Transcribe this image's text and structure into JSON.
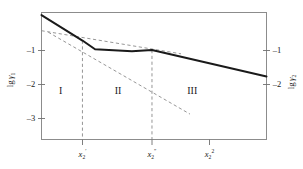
{
  "chart_data": {
    "type": "line",
    "title": "",
    "xlabel": "",
    "ylabel_left": "lg γ1",
    "ylabel_right": "lg γ2",
    "grid": false,
    "legend": "none",
    "xlim": [
      0,
      1
    ],
    "ylim": [
      -3.45,
      -0.1
    ],
    "y_ticks_left": [
      "-1",
      "-2",
      "-3"
    ],
    "y_tick_values_left": [
      -1,
      -2,
      -3
    ],
    "y_ticks_right": [
      "-1",
      "-2"
    ],
    "y_tick_values_right": [
      -1,
      -2
    ],
    "x_ticks": [
      "x2'",
      "x2''",
      "x2^2"
    ],
    "x_tick_positions": [
      0.182,
      0.491,
      0.746
    ],
    "regions": [
      {
        "label": "I",
        "x": 0.085,
        "y": -2.2
      },
      {
        "label": "II",
        "x": 0.34,
        "y": -2.2
      },
      {
        "label": "III",
        "x": 0.67,
        "y": -2.2
      }
    ],
    "series": [
      {
        "name": "solid-curve",
        "style": "solid",
        "points": [
          {
            "x": 0.0,
            "y": -0.17
          },
          {
            "x": 0.182,
            "y": -0.84
          },
          {
            "x": 0.238,
            "y": -1.07
          },
          {
            "x": 0.402,
            "y": -1.12
          },
          {
            "x": 0.491,
            "y": -1.09
          },
          {
            "x": 1.0,
            "y": -1.79
          }
        ]
      },
      {
        "name": "dashed-asymptote-shallow",
        "style": "dashed",
        "points": [
          {
            "x": 0.0,
            "y": -0.58
          },
          {
            "x": 0.62,
            "y": -1.19
          }
        ]
      },
      {
        "name": "dashed-asymptote-steep",
        "style": "dashed",
        "points": [
          {
            "x": 0.03,
            "y": -0.62
          },
          {
            "x": 0.66,
            "y": -2.78
          }
        ]
      }
    ],
    "dividers": [
      {
        "name": "divider-x2-prime",
        "x": 0.182,
        "y_top": -0.84,
        "y_bottom": -3.45
      },
      {
        "name": "divider-x2-dprime",
        "x": 0.491,
        "y_top": -1.09,
        "y_bottom": -3.45
      }
    ]
  },
  "axes": {
    "left": {
      "title_prefix": "lg",
      "title_var": "γ",
      "title_sub": "1",
      "ticks": [
        {
          "label": "–1",
          "value": -1
        },
        {
          "label": "–2",
          "value": -2
        },
        {
          "label": "–3",
          "value": -3
        }
      ]
    },
    "right": {
      "title_prefix": "lg",
      "title_var": "γ",
      "title_sub": "2",
      "ticks": [
        {
          "label": "–1",
          "value": -1
        },
        {
          "label": "–2",
          "value": -2
        }
      ]
    },
    "bottom": {
      "ticks": [
        {
          "base": "x",
          "sub": "2",
          "sup": "′",
          "value": 0.182
        },
        {
          "base": "x",
          "sub": "2",
          "sup": "″",
          "value": 0.491
        },
        {
          "base": "x",
          "sub": "2",
          "sup": "2",
          "value": 0.746
        }
      ]
    }
  },
  "regions": [
    {
      "label": "I"
    },
    {
      "label": "II"
    },
    {
      "label": "III"
    }
  ],
  "colors": {
    "solid_curve": "#1a1a1a",
    "dashed_line": "#8a8a8a",
    "frame": "#8c8c8c",
    "text": "#1a1a1a",
    "background": "#ffffff"
  }
}
